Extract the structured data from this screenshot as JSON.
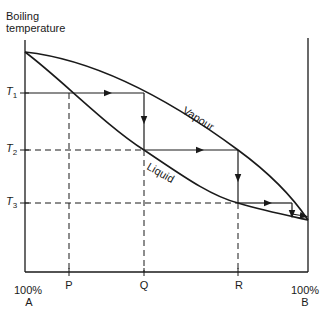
{
  "axis": {
    "y_label_line1": "Boiling",
    "y_label_line2": "temperature",
    "x_left_pct": "100%",
    "x_left_name": "A",
    "x_right_pct": "100%",
    "x_right_name": "B"
  },
  "temperatures": [
    {
      "symbol": "T",
      "sub": "1"
    },
    {
      "symbol": "T",
      "sub": "2"
    },
    {
      "symbol": "T",
      "sub": "3"
    }
  ],
  "compositions": [
    "P",
    "Q",
    "R"
  ],
  "curves": {
    "vapour": "Vapour",
    "liquid": "Liquid"
  },
  "colors": {
    "line": "#1a1a1a",
    "background": "#ffffff"
  }
}
